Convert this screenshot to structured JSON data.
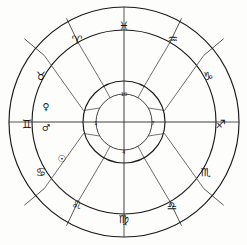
{
  "chart": {
    "type": "zodiac-wheel",
    "center": {
      "x": 124,
      "y": 122
    },
    "radii": {
      "outer": 115,
      "sign_inner": 92,
      "house_inner": 41,
      "number_ring_outer": 41,
      "number_ring_inner": 28
    },
    "colors": {
      "background": "#fdfdfc",
      "stroke": "#1a1a1a",
      "glyph": "#141414"
    }
  },
  "signs": [
    {
      "name": "pisces",
      "glyph": "♓",
      "label": "Pisces",
      "angle_deg": 270,
      "glyph_x": 124,
      "glyph_y": 26
    },
    {
      "name": "aquarius",
      "glyph": "♒",
      "label": "Aquarius",
      "angle_deg": 300,
      "glyph_x": 173,
      "glyph_y": 39
    },
    {
      "name": "capricorn",
      "glyph": "♑",
      "label": "Capricorn",
      "angle_deg": 330,
      "glyph_x": 208,
      "glyph_y": 76
    },
    {
      "name": "sagittarius",
      "glyph": "♐",
      "label": "Sagittarius",
      "angle_deg": 0,
      "glyph_x": 221,
      "glyph_y": 124
    },
    {
      "name": "scorpio",
      "glyph": "♏",
      "label": "Scorpio",
      "angle_deg": 30,
      "glyph_x": 206,
      "glyph_y": 172
    },
    {
      "name": "libra",
      "glyph": "♎",
      "label": "Libra",
      "angle_deg": 60,
      "glyph_x": 172,
      "glyph_y": 206
    },
    {
      "name": "virgo",
      "glyph": "♍",
      "label": "Virgo",
      "angle_deg": 90,
      "glyph_x": 124,
      "glyph_y": 219
    },
    {
      "name": "leo",
      "glyph": "♌",
      "label": "Leo",
      "angle_deg": 120,
      "glyph_x": 77,
      "glyph_y": 205
    },
    {
      "name": "cancer",
      "glyph": "♋",
      "label": "Cancer",
      "angle_deg": 150,
      "glyph_x": 41,
      "glyph_y": 172
    },
    {
      "name": "gemini",
      "glyph": "♊",
      "label": "Gemini",
      "angle_deg": 180,
      "glyph_x": 27,
      "glyph_y": 124
    },
    {
      "name": "taurus",
      "glyph": "♉",
      "label": "Taurus",
      "angle_deg": 210,
      "glyph_x": 41,
      "glyph_y": 76
    },
    {
      "name": "aries",
      "glyph": "♈",
      "label": "Aries",
      "angle_deg": 240,
      "glyph_x": 77,
      "glyph_y": 40
    }
  ],
  "planets": [
    {
      "name": "venus",
      "glyph": "♀",
      "label": "Venus",
      "glyph_x": 46,
      "glyph_y": 106
    },
    {
      "name": "mars",
      "glyph": "♂",
      "label": "Mars",
      "glyph_x": 46,
      "glyph_y": 127
    },
    {
      "name": "sun",
      "glyph": "☉",
      "label": "Sun",
      "glyph_x": 62,
      "glyph_y": 158
    }
  ],
  "houses": [
    {
      "name": "house-10",
      "number": "10",
      "label": "Midheaven",
      "x": 124,
      "y": 94
    },
    {
      "name": "house-1",
      "number": "1",
      "label": "Ascendant",
      "x": 96,
      "y": 123
    },
    {
      "name": "house-7",
      "number": "7",
      "label": "Descendant",
      "x": 153,
      "y": 123
    },
    {
      "name": "house-4",
      "number": "4",
      "label": "Imum Coeli",
      "x": 124,
      "y": 152
    }
  ]
}
